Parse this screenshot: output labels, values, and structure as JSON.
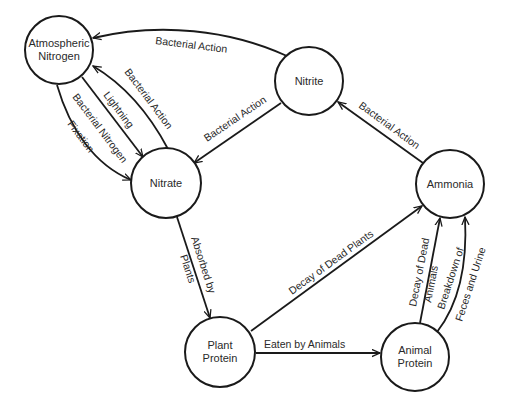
{
  "diagram": {
    "nodes": [
      {
        "id": "atmospheric_nitrogen",
        "lines": [
          "Atmospheric",
          "Nitrogen"
        ]
      },
      {
        "id": "nitrite",
        "lines": [
          "Nitrite"
        ]
      },
      {
        "id": "nitrate",
        "lines": [
          "Nitrate"
        ]
      },
      {
        "id": "ammonia",
        "lines": [
          "Ammonia"
        ]
      },
      {
        "id": "plant_protein",
        "lines": [
          "Plant",
          "Protein"
        ]
      },
      {
        "id": "animal_protein",
        "lines": [
          "Animal",
          "Protein"
        ]
      }
    ],
    "edges": [
      {
        "from": "nitrite",
        "to": "atmospheric_nitrogen",
        "label": "Bacterial Action"
      },
      {
        "from": "nitrate",
        "to": "atmospheric_nitrogen",
        "label": "Bacterial Action"
      },
      {
        "from": "atmospheric_nitrogen",
        "to": "nitrate",
        "label": "Lightning"
      },
      {
        "from": "atmospheric_nitrogen",
        "to": "nitrate",
        "label_lines": [
          "Bacterial Nitrogen",
          "Fixation"
        ]
      },
      {
        "from": "nitrite",
        "to": "nitrate",
        "label": "Bacterial Action"
      },
      {
        "from": "ammonia",
        "to": "nitrite",
        "label": "Bacterial Action"
      },
      {
        "from": "nitrate",
        "to": "plant_protein",
        "label_lines": [
          "Absorbed by",
          "Plants"
        ]
      },
      {
        "from": "plant_protein",
        "to": "ammonia",
        "label": "Decay of Dead Plants"
      },
      {
        "from": "plant_protein",
        "to": "animal_protein",
        "label": "Eaten by Animals"
      },
      {
        "from": "animal_protein",
        "to": "ammonia",
        "label_lines": [
          "Decay of Dead",
          "Animals"
        ]
      },
      {
        "from": "animal_protein",
        "to": "ammonia",
        "label_lines": [
          "Breakdown of",
          "Feces and Urine"
        ]
      }
    ]
  }
}
